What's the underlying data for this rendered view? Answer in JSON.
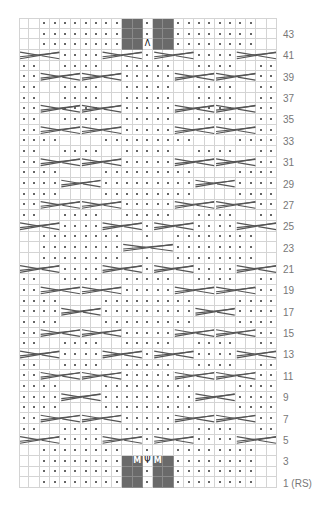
{
  "chart": {
    "columns": 25,
    "rows": 44,
    "row_labels": [
      {
        "row": 43,
        "text": "43"
      },
      {
        "row": 41,
        "text": "41"
      },
      {
        "row": 39,
        "text": "39"
      },
      {
        "row": 37,
        "text": "37"
      },
      {
        "row": 35,
        "text": "35"
      },
      {
        "row": 33,
        "text": "33"
      },
      {
        "row": 31,
        "text": "31"
      },
      {
        "row": 29,
        "text": "29"
      },
      {
        "row": 27,
        "text": "27"
      },
      {
        "row": 25,
        "text": "25"
      },
      {
        "row": 23,
        "text": "23"
      },
      {
        "row": 21,
        "text": "21"
      },
      {
        "row": 19,
        "text": "19"
      },
      {
        "row": 17,
        "text": "17"
      },
      {
        "row": 15,
        "text": "15"
      },
      {
        "row": 13,
        "text": "13"
      },
      {
        "row": 11,
        "text": "11"
      },
      {
        "row": 9,
        "text": "9"
      },
      {
        "row": 7,
        "text": "7"
      },
      {
        "row": 5,
        "text": "5"
      },
      {
        "row": 3,
        "text": "3"
      },
      {
        "row": 1,
        "text": "1 (RS)"
      }
    ],
    "symbols": {
      "dot": "purl (dot)",
      "dark": "no stitch (grey)",
      "M": "make one",
      "psi": "centered increase",
      "lambda": "centered decrease"
    },
    "special_cells": [
      {
        "row": 3,
        "col": 11,
        "text": "M",
        "dark": true
      },
      {
        "row": 3,
        "col": 12,
        "text": "Ψ",
        "dark": false
      },
      {
        "row": 3,
        "col": 13,
        "text": "M",
        "dark": true
      },
      {
        "row": 42,
        "col": 12,
        "text": "Λ",
        "dark": false
      }
    ],
    "colors": {
      "grid": "#d4d4d4",
      "dark_cell": "#6a6a6a",
      "dot": "#333333",
      "cable": "#555555",
      "label": "#777777"
    }
  }
}
